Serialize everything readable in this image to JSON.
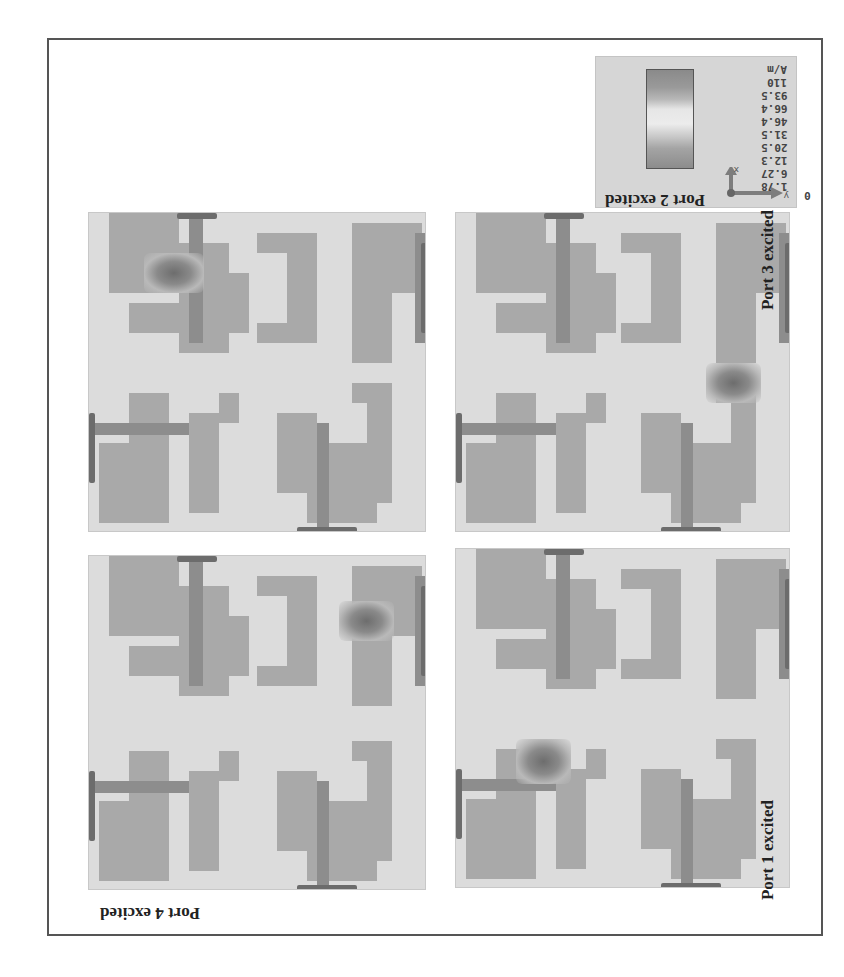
{
  "figure": {
    "panels": [
      {
        "id": "port4",
        "label": "Port 4 excited",
        "excited_port": 4
      },
      {
        "id": "port3",
        "label": "Port 3 excited",
        "excited_port": 3
      },
      {
        "id": "port1",
        "label": "Port 1 excited",
        "excited_port": 1
      },
      {
        "id": "port2",
        "label": "Port 2 excited",
        "excited_port": 2
      }
    ],
    "legend": {
      "unit": "A/m",
      "values": [
        "110",
        "93.5",
        "66.4",
        "46.4",
        "31.5",
        "20.5",
        "12.3",
        "6.27",
        "1.78",
        "0"
      ]
    },
    "axes": {
      "x": "x",
      "y": "y",
      "z": "z"
    },
    "colors": {
      "substrate": "#dcdcdc",
      "patch": "#a9a9a9",
      "feedline": "#8d8d8d",
      "port": "#6c6c6c",
      "frame": "#555555"
    }
  }
}
